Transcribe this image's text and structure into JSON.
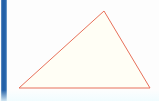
{
  "canvas": {
    "width": 159,
    "height": 101,
    "background_color": "#fdfdfd",
    "bottom_tint_color": "#eefcff"
  },
  "left_accent_bar": {
    "name": "left-accent-bar",
    "color": "#1f5fa8",
    "edge_color": "#9dbfde",
    "x": 1,
    "y": 0,
    "width": 6,
    "height": 101
  },
  "figure": {
    "type": "triangle",
    "stroke_color": "#e8705a",
    "fill_color": "#fffef5",
    "stroke_width": 1,
    "points": "104,11 150,88 19,88",
    "vertices": [
      {
        "label": "apex",
        "x": 104,
        "y": 11
      },
      {
        "label": "bottom-right",
        "x": 150,
        "y": 88
      },
      {
        "label": "bottom-left",
        "x": 19,
        "y": 88
      }
    ]
  }
}
